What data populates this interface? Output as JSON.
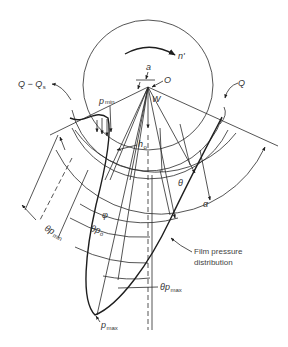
{
  "figure": {
    "type": "journal bearing film pressure diagram",
    "colors": {
      "line": "#1e1e1e",
      "text": "#333333",
      "background": "#ffffff"
    }
  },
  "labels": {
    "rotation": "n'",
    "eccentricity": "a",
    "center": "O",
    "load": "W",
    "flow_in_right": "Q",
    "flow_out_left": "Q − Q",
    "flow_out_left_sub": "s",
    "p_min": "p",
    "p_min_sub": "min",
    "h_o": "h",
    "h_o_sub": "o",
    "theta": "θ",
    "alpha": "α",
    "phi": "φ",
    "theta_p_min": "θp",
    "theta_p_min_sub": "min",
    "theta_p_o": "θp",
    "theta_p_o_sub": "o",
    "theta_p_max": "θp",
    "theta_p_max_sub": "max",
    "p_max": "p",
    "p_max_sub": "max",
    "film_pressure_line1": "Film pressure",
    "film_pressure_line2": "distribution"
  }
}
